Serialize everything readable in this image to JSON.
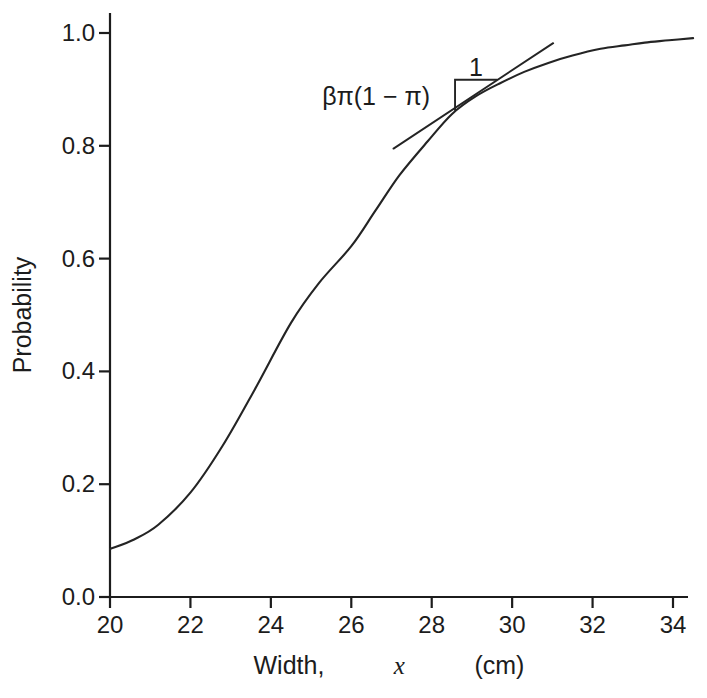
{
  "figure": {
    "width_px": 707,
    "height_px": 698,
    "background_color": "#ffffff",
    "ink_color": "#1c1c1c"
  },
  "chart_data": {
    "type": "line",
    "title": "",
    "xlabel": "Width, x (cm)",
    "xlabel_parts": {
      "prefix": "Width, ",
      "variable": "x",
      "suffix": " (cm)"
    },
    "ylabel": "Probability",
    "xlim": [
      20,
      34.5
    ],
    "ylim": [
      0,
      1.0
    ],
    "grid": false,
    "legend": false,
    "x_ticks": [
      {
        "value": 20,
        "label": "20"
      },
      {
        "value": 22,
        "label": "22"
      },
      {
        "value": 24,
        "label": "24"
      },
      {
        "value": 26,
        "label": "26"
      },
      {
        "value": 28,
        "label": "28"
      },
      {
        "value": 30,
        "label": "30"
      },
      {
        "value": 32,
        "label": "32"
      },
      {
        "value": 34,
        "label": "34"
      }
    ],
    "y_ticks": [
      {
        "value": 0.0,
        "label": "0.0"
      },
      {
        "value": 0.2,
        "label": "0.2"
      },
      {
        "value": 0.4,
        "label": "0.4"
      },
      {
        "value": 0.6,
        "label": "0.6"
      },
      {
        "value": 0.8,
        "label": "0.8"
      },
      {
        "value": 1.0,
        "label": "1.0"
      }
    ],
    "series": [
      {
        "name": "logistic-probability-curve",
        "x": [
          20.0,
          20.6,
          21.2,
          22.0,
          22.8,
          23.6,
          24.5,
          25.2,
          26.0,
          26.6,
          27.2,
          27.9,
          28.5,
          29.1,
          29.7,
          30.3,
          30.9,
          31.5,
          32.2,
          32.8,
          33.3,
          33.9,
          34.5
        ],
        "y": [
          0.085,
          0.102,
          0.128,
          0.185,
          0.268,
          0.368,
          0.486,
          0.557,
          0.622,
          0.685,
          0.748,
          0.808,
          0.856,
          0.888,
          0.911,
          0.931,
          0.947,
          0.96,
          0.972,
          0.978,
          0.983,
          0.987,
          0.991
        ]
      }
    ],
    "tangent_line": {
      "x1": 27.05,
      "y1": 0.795,
      "x2": 31.02,
      "y2": 0.982
    },
    "slope_triangle": {
      "corner_x": 28.58,
      "corner_y": 0.917,
      "bottom_y": 0.862,
      "right_x": 29.63
    },
    "annotations": {
      "slope_label": {
        "text": "βπ(1 − π)",
        "x": 27.96,
        "y": 0.872
      },
      "run_label": {
        "text": "1",
        "x": 29.1,
        "y": 0.924
      }
    }
  }
}
